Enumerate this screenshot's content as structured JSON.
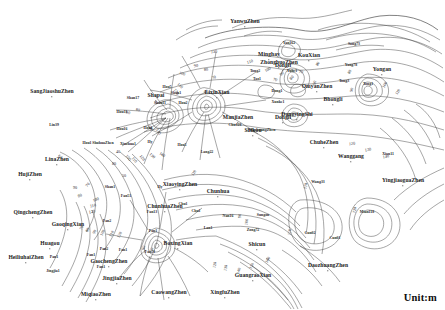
{
  "map": {
    "title": "Groundwater Depth Contour Map",
    "unit_label": "Unit:m",
    "contour_interval": 10,
    "contour_min": 60,
    "contour_max": 160,
    "background_color": "#ffffff",
    "line_color": "#3a3a3a"
  },
  "chart_data": {
    "type": "contour",
    "unit": "m",
    "contour_levels": [
      60,
      70,
      80,
      90,
      100,
      110,
      120,
      130,
      140,
      150,
      160
    ],
    "interval": 10,
    "legend": "Unit:m"
  },
  "contour_labels": [
    {
      "value": "130",
      "x": 214,
      "y": 52,
      "rot": -6
    },
    {
      "value": "110",
      "x": 250,
      "y": 62,
      "rot": -18
    },
    {
      "value": "100",
      "x": 268,
      "y": 70,
      "rot": -30
    },
    {
      "value": "90",
      "x": 282,
      "y": 74,
      "rot": -40
    },
    {
      "value": "80",
      "x": 292,
      "y": 78,
      "rot": -48
    },
    {
      "value": "70",
      "x": 301,
      "y": 72,
      "rot": 12
    },
    {
      "value": "70",
      "x": 275,
      "y": 80,
      "rot": 20
    },
    {
      "value": "80",
      "x": 318,
      "y": 64,
      "rot": -58
    },
    {
      "value": "90",
      "x": 315,
      "y": 83,
      "rot": -70
    },
    {
      "value": "80",
      "x": 350,
      "y": 72,
      "rot": -62
    },
    {
      "value": "90",
      "x": 352,
      "y": 90,
      "rot": -72
    },
    {
      "value": "100",
      "x": 385,
      "y": 85,
      "rot": -60
    },
    {
      "value": "110",
      "x": 398,
      "y": 92,
      "rot": -58
    },
    {
      "value": "120",
      "x": 352,
      "y": 144,
      "rot": -6
    },
    {
      "value": "130",
      "x": 368,
      "y": 150,
      "rot": -10
    },
    {
      "value": "140",
      "x": 386,
      "y": 157,
      "rot": -12
    },
    {
      "value": "110",
      "x": 306,
      "y": 186,
      "rot": -80
    },
    {
      "value": "120",
      "x": 355,
      "y": 210,
      "rot": -80
    },
    {
      "value": "120",
      "x": 215,
      "y": 265,
      "rot": -78
    },
    {
      "value": "130",
      "x": 226,
      "y": 268,
      "rot": -78
    },
    {
      "value": "140",
      "x": 239,
      "y": 271,
      "rot": -72
    },
    {
      "value": "150",
      "x": 252,
      "y": 266,
      "rot": -66
    },
    {
      "value": "160",
      "x": 268,
      "y": 260,
      "rot": -60
    },
    {
      "value": "60",
      "x": 206,
      "y": 92,
      "rot": -14
    },
    {
      "value": "70",
      "x": 214,
      "y": 78,
      "rot": -22
    },
    {
      "value": "80",
      "x": 206,
      "y": 70,
      "rot": -12
    },
    {
      "value": "90",
      "x": 196,
      "y": 66,
      "rot": -8
    },
    {
      "value": "100",
      "x": 182,
      "y": 74,
      "rot": 18
    },
    {
      "value": "110",
      "x": 180,
      "y": 86,
      "rot": 42
    },
    {
      "value": "120",
      "x": 176,
      "y": 92,
      "rot": 58
    },
    {
      "value": "80",
      "x": 138,
      "y": 110,
      "rot": 8
    },
    {
      "value": "90",
      "x": 128,
      "y": 113,
      "rot": 6
    },
    {
      "value": "70",
      "x": 88,
      "y": 185,
      "rot": -50
    },
    {
      "value": "80",
      "x": 80,
      "y": 196,
      "rot": -20
    },
    {
      "value": "90",
      "x": 75,
      "y": 188,
      "rot": 0
    },
    {
      "value": "100",
      "x": 96,
      "y": 200,
      "rot": -22
    },
    {
      "value": "110",
      "x": 93,
      "y": 206,
      "rot": -14
    },
    {
      "value": "120",
      "x": 92,
      "y": 212,
      "rot": -10
    },
    {
      "value": "60",
      "x": 60,
      "y": 157,
      "rot": 40
    },
    {
      "value": "70",
      "x": 82,
      "y": 228,
      "rot": -62
    },
    {
      "value": "80",
      "x": 88,
      "y": 230,
      "rot": -62
    },
    {
      "value": "90",
      "x": 95,
      "y": 232,
      "rot": -62
    },
    {
      "value": "100",
      "x": 103,
      "y": 233,
      "rot": -62
    },
    {
      "value": "110",
      "x": 112,
      "y": 234,
      "rot": -62
    },
    {
      "value": "120",
      "x": 120,
      "y": 235,
      "rot": -62
    },
    {
      "value": "100",
      "x": 128,
      "y": 158,
      "rot": 52
    },
    {
      "value": "110",
      "x": 134,
      "y": 160,
      "rot": 52
    },
    {
      "value": "120",
      "x": 142,
      "y": 158,
      "rot": 50
    },
    {
      "value": "130",
      "x": 152,
      "y": 156,
      "rot": 44
    },
    {
      "value": "140",
      "x": 162,
      "y": 155,
      "rot": 36
    },
    {
      "value": "110",
      "x": 194,
      "y": 173,
      "rot": -58
    },
    {
      "value": "100",
      "x": 150,
      "y": 128,
      "rot": 56
    },
    {
      "value": "110",
      "x": 158,
      "y": 132,
      "rot": 60
    },
    {
      "value": "40",
      "x": 118,
      "y": 152,
      "rot": 0
    },
    {
      "value": "50",
      "x": 124,
      "y": 176,
      "rot": 0
    },
    {
      "value": "60",
      "x": 144,
      "y": 248,
      "rot": -68
    },
    {
      "value": "70",
      "x": 152,
      "y": 250,
      "rot": -68
    },
    {
      "value": "80",
      "x": 114,
      "y": 164,
      "rot": 0
    },
    {
      "value": "90",
      "x": 240,
      "y": 216,
      "rot": -84
    },
    {
      "value": "100",
      "x": 247,
      "y": 222,
      "rot": -84
    },
    {
      "value": "110",
      "x": 290,
      "y": 232,
      "rot": -84
    }
  ],
  "places": {
    "major": [
      {
        "label": "SangJiaoshuZhen",
        "x": 52,
        "y": 92
      },
      {
        "label": "LinaZhen",
        "x": 57,
        "y": 160
      },
      {
        "label": "HujiZhen",
        "x": 30,
        "y": 175
      },
      {
        "label": "QingchengZhen",
        "x": 33,
        "y": 213
      },
      {
        "label": "GaoqingXian",
        "x": 68,
        "y": 225
      },
      {
        "label": "Huagou",
        "x": 50,
        "y": 244
      },
      {
        "label": "HeiliuhaiZhen",
        "x": 26,
        "y": 258
      },
      {
        "label": "GaochengZhen",
        "x": 109,
        "y": 262
      },
      {
        "label": "JingjiaZhen",
        "x": 117,
        "y": 279
      },
      {
        "label": "MiqiaoZhen",
        "x": 96,
        "y": 295
      },
      {
        "label": "CaowangZhen",
        "x": 169,
        "y": 293
      },
      {
        "label": "XingfuZhen",
        "x": 225,
        "y": 293
      },
      {
        "label": "GuangraoXian",
        "x": 253,
        "y": 276
      },
      {
        "label": "DaozhuangZhen",
        "x": 328,
        "y": 266
      },
      {
        "label": "BoxingXian",
        "x": 178,
        "y": 244
      },
      {
        "label": "ChunhuaZhen",
        "x": 165,
        "y": 207
      },
      {
        "label": "Chunhua",
        "x": 218,
        "y": 192
      },
      {
        "label": "XiaoyingZhen",
        "x": 180,
        "y": 185
      },
      {
        "label": "Shicun",
        "x": 257,
        "y": 245
      },
      {
        "label": "Shikou",
        "x": 253,
        "y": 131
      },
      {
        "label": "ManjiaZhen",
        "x": 238,
        "y": 118
      },
      {
        "label": "LixinXian",
        "x": 217,
        "y": 93
      },
      {
        "label": "Shapai",
        "x": 156,
        "y": 96
      },
      {
        "label": "Minghay",
        "x": 269,
        "y": 55
      },
      {
        "label": "ZhongbuoZhen",
        "x": 279,
        "y": 63
      },
      {
        "label": "KouXian",
        "x": 309,
        "y": 56
      },
      {
        "label": "Dongli",
        "x": 283,
        "y": 66
      },
      {
        "label": "Dongli",
        "x": 283,
        "y": 118
      },
      {
        "label": "YanwuZhen",
        "x": 245,
        "y": 22
      },
      {
        "label": "OmyanZhen",
        "x": 317,
        "y": 87
      },
      {
        "label": "DongyingShi",
        "x": 297,
        "y": 115
      },
      {
        "label": "Bhongli",
        "x": 333,
        "y": 100
      },
      {
        "label": "Yongan",
        "x": 382,
        "y": 70
      },
      {
        "label": "ChuheZhen",
        "x": 324,
        "y": 143
      },
      {
        "label": "Wanggang",
        "x": 351,
        "y": 157
      },
      {
        "label": "YingjiaoguaZhen",
        "x": 403,
        "y": 181
      }
    ],
    "minor": [
      {
        "label": "Lin39",
        "x": 54,
        "y": 126
      },
      {
        "label": "Pan1",
        "x": 54,
        "y": 258
      },
      {
        "label": "Jingjia1",
        "x": 53,
        "y": 272
      },
      {
        "label": "Pan2",
        "x": 104,
        "y": 250
      },
      {
        "label": "Fan2",
        "x": 107,
        "y": 222
      },
      {
        "label": "Fan51",
        "x": 126,
        "y": 197
      },
      {
        "label": "Fan13",
        "x": 152,
        "y": 213
      },
      {
        "label": "Fan51",
        "x": 150,
        "y": 253
      },
      {
        "label": "Pan1",
        "x": 153,
        "y": 232
      },
      {
        "label": "Hou1",
        "x": 87,
        "y": 144
      },
      {
        "label": "ShuhuaZhen",
        "x": 103,
        "y": 144
      },
      {
        "label": "Xinzhua1",
        "x": 128,
        "y": 145
      },
      {
        "label": "Hou16",
        "x": 122,
        "y": 130
      },
      {
        "label": "Hou11",
        "x": 122,
        "y": 113
      },
      {
        "label": "Hou1",
        "x": 148,
        "y": 129
      },
      {
        "label": "Shan17",
        "x": 133,
        "y": 99
      },
      {
        "label": "Shan11",
        "x": 160,
        "y": 104
      },
      {
        "label": "Shan1",
        "x": 176,
        "y": 94
      },
      {
        "label": "Hou5",
        "x": 167,
        "y": 88
      },
      {
        "label": "Hou2",
        "x": 183,
        "y": 104
      },
      {
        "label": "Hou5",
        "x": 182,
        "y": 146
      },
      {
        "label": "Lang22",
        "x": 207,
        "y": 153
      },
      {
        "label": "Chu128",
        "x": 235,
        "y": 126
      },
      {
        "label": "WuzhuangZhen",
        "x": 262,
        "y": 131
      },
      {
        "label": "Yan162",
        "x": 289,
        "y": 44
      },
      {
        "label": "Tong2",
        "x": 255,
        "y": 72
      },
      {
        "label": "Tao1",
        "x": 257,
        "y": 80
      },
      {
        "label": "Yuhe1",
        "x": 292,
        "y": 72
      },
      {
        "label": "Dong1",
        "x": 277,
        "y": 92
      },
      {
        "label": "Xunke1",
        "x": 278,
        "y": 103
      },
      {
        "label": "Tong3",
        "x": 344,
        "y": 82
      },
      {
        "label": "Yang78",
        "x": 351,
        "y": 66
      },
      {
        "label": "Song73",
        "x": 354,
        "y": 45
      },
      {
        "label": "Tong1",
        "x": 368,
        "y": 85
      },
      {
        "label": "Xian11",
        "x": 388,
        "y": 155
      },
      {
        "label": "Wang33",
        "x": 318,
        "y": 183
      },
      {
        "label": "Mian118",
        "x": 367,
        "y": 213
      },
      {
        "label": "Cun02",
        "x": 310,
        "y": 234
      },
      {
        "label": "Chu1",
        "x": 183,
        "y": 205
      },
      {
        "label": "Chu1",
        "x": 196,
        "y": 212
      },
      {
        "label": "Lan1",
        "x": 208,
        "y": 229
      },
      {
        "label": "Nan16",
        "x": 228,
        "y": 217
      },
      {
        "label": "Zong72",
        "x": 253,
        "y": 231
      },
      {
        "label": "Sungon",
        "x": 263,
        "y": 216
      },
      {
        "label": "Cun01",
        "x": 335,
        "y": 239
      },
      {
        "label": "Fan1",
        "x": 91,
        "y": 256
      },
      {
        "label": "Fan1",
        "x": 101,
        "y": 268
      },
      {
        "label": "Fan1",
        "x": 123,
        "y": 251
      },
      {
        "label": "Shan1",
        "x": 110,
        "y": 188
      },
      {
        "label": "Hy",
        "x": 160,
        "y": 188
      },
      {
        "label": "Hy",
        "x": 150,
        "y": 143
      }
    ]
  }
}
